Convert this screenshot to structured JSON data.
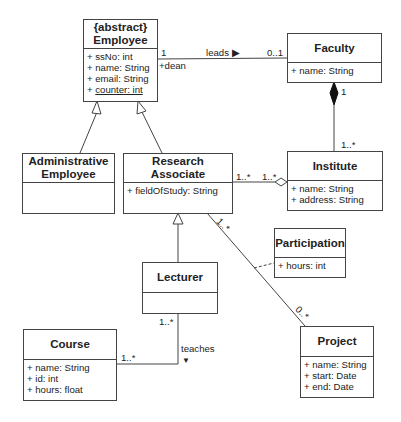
{
  "classes": {
    "employee": {
      "stereotype": "{abstract}",
      "name": "Employee",
      "attributes": [
        "+ ssNo: int",
        "+ name: String",
        "+ email: String"
      ],
      "static_attribute": "counter: int",
      "static_prefix": "+ "
    },
    "faculty": {
      "name": "Faculty",
      "attributes": [
        "+ name: String"
      ]
    },
    "administrative_employee": {
      "name_line1": "Administrative",
      "name_line2": "Employee",
      "attributes": []
    },
    "research_associate": {
      "name_line1": "Research",
      "name_line2": "Associate",
      "attributes": [
        "+ fieldOfStudy: String"
      ]
    },
    "institute": {
      "name": "Institute",
      "attributes": [
        "+ name: String",
        "+ address: String"
      ]
    },
    "participation": {
      "name": "Participation",
      "attributes": [
        "+ hours: int"
      ]
    },
    "lecturer": {
      "name": "Lecturer",
      "attributes": []
    },
    "course": {
      "name": "Course",
      "attributes": [
        "+ name: String",
        "+ id: int",
        "+ hours: float"
      ]
    },
    "project": {
      "name": "Project",
      "attributes": [
        "+ name: String",
        "+ start: Date",
        "+ end: Date"
      ]
    }
  },
  "associations": {
    "leads": {
      "label": "leads ▶",
      "employee_mult": "1",
      "employee_role": "+dean",
      "faculty_mult": "0..1"
    },
    "faculty_institute": {
      "faculty_mult": "1",
      "institute_mult": "1..*"
    },
    "ra_institute": {
      "ra_mult": "1..*",
      "institute_mult": "1..*"
    },
    "ra_project": {
      "ra_mult": "1..*",
      "project_mult": "0..*"
    },
    "teaches": {
      "label": "teaches",
      "arrow": "▼",
      "lecturer_mult": "1..*",
      "course_mult": "1..*"
    }
  }
}
